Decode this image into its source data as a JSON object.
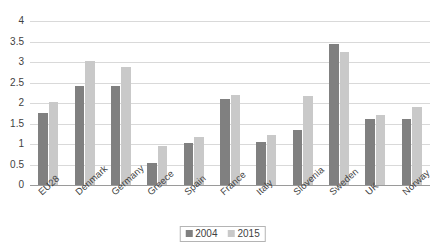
{
  "chart_data": {
    "type": "bar",
    "title": "",
    "subtitle": "",
    "xlabel": "",
    "ylabel": "",
    "ylim": [
      0,
      4
    ],
    "yticks": [
      0,
      0.5,
      1,
      1.5,
      2,
      2.5,
      3,
      3.5,
      4
    ],
    "ytick_labels": [
      "0",
      "0.5",
      "1",
      "1.5",
      "2",
      "2.5",
      "3",
      "3.5",
      "4"
    ],
    "grid": true,
    "legend_position": "bottom-center",
    "categories": [
      "EU28",
      "Denmark",
      "Germany",
      "Greece",
      "Spain",
      "France",
      "Italy",
      "Slovenia",
      "Sweden",
      "UK",
      "Norway"
    ],
    "series": [
      {
        "name": "2004",
        "color": "#808080",
        "values": [
          1.75,
          2.42,
          2.42,
          0.53,
          1.03,
          2.1,
          1.05,
          1.35,
          3.45,
          1.6,
          1.6
        ]
      },
      {
        "name": "2015",
        "color": "#c9c9c9",
        "values": [
          2.02,
          3.03,
          2.88,
          0.96,
          1.18,
          2.2,
          1.22,
          2.18,
          3.25,
          1.7,
          1.9
        ]
      }
    ]
  }
}
